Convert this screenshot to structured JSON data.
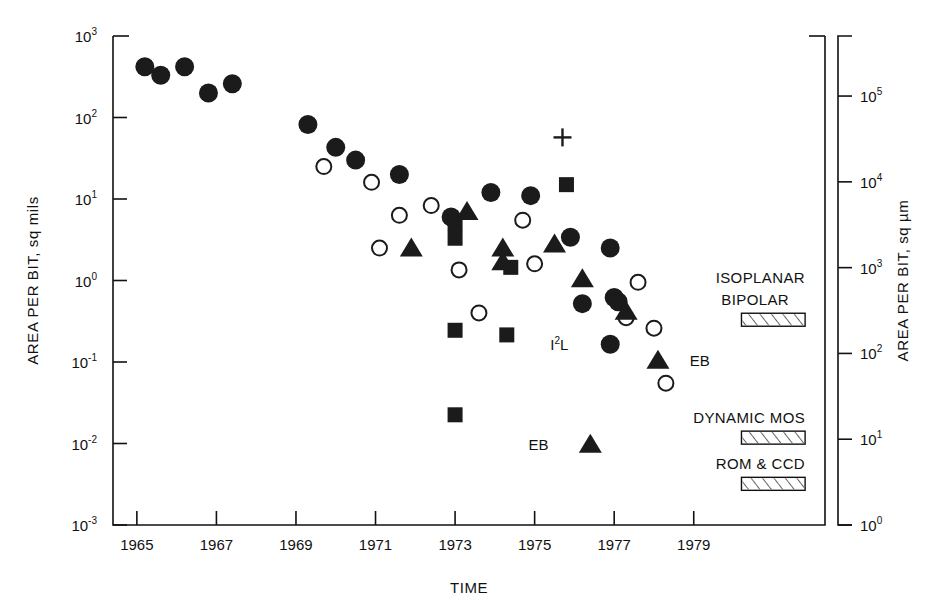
{
  "chart_data": {
    "type": "scatter",
    "title": "",
    "xlabel": "TIME",
    "ylabel": "AREA PER BIT, sq mils",
    "ylabel_right": "AREA PER BIT, sq µm",
    "xlim": [
      1964.4,
      1982.3
    ],
    "ylim": [
      -3,
      3
    ],
    "ylim_right": [
      0,
      5.7
    ],
    "yscale": "log",
    "grid": false,
    "legend": "none",
    "x_ticks": [
      "1965",
      "1967",
      "1969",
      "1971",
      "1973",
      "1975",
      "1977",
      "1979"
    ],
    "x_tick_values": [
      1965,
      1967,
      1969,
      1971,
      1973,
      1975,
      1977,
      1979
    ],
    "y_ticks": [
      "10³",
      "10²",
      "10¹",
      "10⁰",
      "10⁻¹",
      "10⁻²",
      "10⁻³"
    ],
    "y_tick_mantissa": [
      "10",
      "10",
      "10",
      "10",
      "10",
      "10",
      "10"
    ],
    "y_tick_exponents": [
      "3",
      "2",
      "1",
      "0",
      "-1",
      "-2",
      "-3"
    ],
    "y_tick_values": [
      3,
      2,
      1,
      0,
      -1,
      -2,
      -3
    ],
    "y_ticks_right": [
      "10⁵",
      "10⁴",
      "10³",
      "10²",
      "10¹",
      "10⁰"
    ],
    "y_tick_right_exponents": [
      "5",
      "4",
      "3",
      "2",
      "1",
      "0"
    ],
    "y_tick_right_values": [
      5,
      4,
      3,
      2,
      1,
      0
    ],
    "series": [
      {
        "name": "filled-circle",
        "marker": "filled-circle",
        "color": "#1b1b1b",
        "points": [
          {
            "x": 1965.2,
            "y": 420
          },
          {
            "x": 1965.6,
            "y": 330
          },
          {
            "x": 1966.2,
            "y": 420
          },
          {
            "x": 1966.8,
            "y": 200
          },
          {
            "x": 1967.4,
            "y": 260
          },
          {
            "x": 1969.3,
            "y": 82
          },
          {
            "x": 1970.0,
            "y": 43
          },
          {
            "x": 1970.5,
            "y": 30
          },
          {
            "x": 1971.6,
            "y": 20
          },
          {
            "x": 1972.9,
            "y": 6.0
          },
          {
            "x": 1973.9,
            "y": 12
          },
          {
            "x": 1974.9,
            "y": 11
          },
          {
            "x": 1975.9,
            "y": 3.4
          },
          {
            "x": 1976.9,
            "y": 2.5
          },
          {
            "x": 1976.2,
            "y": 0.52
          },
          {
            "x": 1977.0,
            "y": 0.62
          },
          {
            "x": 1977.1,
            "y": 0.55
          },
          {
            "x": 1976.9,
            "y": 0.165
          }
        ]
      },
      {
        "name": "open-circle",
        "marker": "open-circle",
        "color": "#1b1b1b",
        "points": [
          {
            "x": 1969.7,
            "y": 25
          },
          {
            "x": 1970.9,
            "y": 16
          },
          {
            "x": 1971.6,
            "y": 6.3
          },
          {
            "x": 1971.1,
            "y": 2.5
          },
          {
            "x": 1972.4,
            "y": 8.3
          },
          {
            "x": 1973.1,
            "y": 1.35
          },
          {
            "x": 1973.6,
            "y": 0.4
          },
          {
            "x": 1974.7,
            "y": 5.5
          },
          {
            "x": 1975.0,
            "y": 1.6
          },
          {
            "x": 1977.6,
            "y": 0.95
          },
          {
            "x": 1977.3,
            "y": 0.35
          },
          {
            "x": 1978.0,
            "y": 0.26
          },
          {
            "x": 1978.3,
            "y": 0.055
          }
        ]
      },
      {
        "name": "filled-triangle",
        "marker": "filled-triangle",
        "color": "#1b1b1b",
        "points": [
          {
            "x": 1971.9,
            "y": 2.5
          },
          {
            "x": 1973.3,
            "y": 7.0
          },
          {
            "x": 1974.2,
            "y": 2.5
          },
          {
            "x": 1974.2,
            "y": 1.7
          },
          {
            "x": 1975.5,
            "y": 2.8
          },
          {
            "x": 1976.2,
            "y": 1.05
          },
          {
            "x": 1977.3,
            "y": 0.42
          },
          {
            "x": 1978.1,
            "y": 0.105
          },
          {
            "x": 1976.4,
            "y": 0.0098
          }
        ]
      },
      {
        "name": "filled-square",
        "marker": "filled-square",
        "color": "#1b1b1b",
        "points": [
          {
            "x": 1973.0,
            "y": 5.0
          },
          {
            "x": 1973.0,
            "y": 3.3
          },
          {
            "x": 1973.0,
            "y": 0.245
          },
          {
            "x": 1973.0,
            "y": 0.0225
          },
          {
            "x": 1974.4,
            "y": 1.45
          },
          {
            "x": 1974.3,
            "y": 0.215
          },
          {
            "x": 1975.8,
            "y": 15
          }
        ]
      },
      {
        "name": "plus",
        "marker": "plus",
        "color": "#1b1b1b",
        "points": [
          {
            "x": 1975.7,
            "y": 57
          }
        ]
      }
    ],
    "point_annotations": [
      {
        "text": "I",
        "sup": "2",
        "tail": "L",
        "x": 1976.2,
        "y": 0.165,
        "side": "left"
      },
      {
        "text": "EB",
        "x": 1978.5,
        "y": 0.105,
        "side": "right"
      },
      {
        "text": "EB",
        "x": 1975.7,
        "y": 0.0098,
        "side": "left"
      }
    ],
    "technology_bars": [
      {
        "label_line1": "ISOPLANAR",
        "label_line2": "BIPOLAR",
        "y": 0.33,
        "x_start": 1980.2,
        "x_end": 1981.8
      },
      {
        "label_line1": "DYNAMIC MOS",
        "label_line2": "",
        "y": 0.0118,
        "x_start": 1980.2,
        "x_end": 1981.8
      },
      {
        "label_line1": "ROM & CCD",
        "label_line2": "",
        "y": 0.0032,
        "x_start": 1980.2,
        "x_end": 1981.8
      }
    ]
  }
}
